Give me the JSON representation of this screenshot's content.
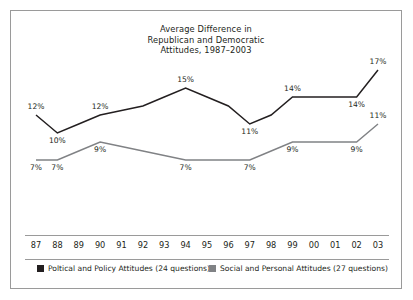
{
  "chart_data": {
    "type": "line",
    "title": "Average Difference in Republican and Democratic Attitudes, 1987–2003",
    "title_lines": [
      "Average Difference in",
      "Republican and Democratic",
      "Attitudes, 1987–2003"
    ],
    "xlabel": "",
    "ylabel": "",
    "ylim": [
      0,
      20
    ],
    "grid": false,
    "legend_position": "bottom",
    "categories": [
      "87",
      "88",
      "89",
      "90",
      "91",
      "92",
      "93",
      "94",
      "95",
      "96",
      "97",
      "98",
      "99",
      "00",
      "01",
      "02",
      "03"
    ],
    "series": [
      {
        "name": "Poltical and Policy Attitudes (24 questions)",
        "color": "#231f20",
        "values": [
          12,
          10,
          11,
          12,
          12.5,
          13,
          14,
          15,
          14,
          13,
          11,
          12,
          14,
          14,
          14,
          14,
          17
        ],
        "labels": [
          {
            "index": 0,
            "text": "12%",
            "pos": "above"
          },
          {
            "index": 1,
            "text": "10%",
            "pos": "below"
          },
          {
            "index": 3,
            "text": "12%",
            "pos": "above"
          },
          {
            "index": 7,
            "text": "15%",
            "pos": "above"
          },
          {
            "index": 10,
            "text": "11%",
            "pos": "below"
          },
          {
            "index": 12,
            "text": "14%",
            "pos": "above"
          },
          {
            "index": 15,
            "text": "14%",
            "pos": "below"
          },
          {
            "index": 16,
            "text": "17%",
            "pos": "above"
          }
        ]
      },
      {
        "name": "Social and Personal Attitudes (27 questions)",
        "color": "#808285",
        "values": [
          7,
          7,
          8,
          9,
          8.5,
          8,
          7.5,
          7,
          7,
          7,
          7,
          8,
          9,
          9,
          9,
          9,
          11
        ],
        "labels": [
          {
            "index": 0,
            "text": "7%",
            "pos": "below"
          },
          {
            "index": 1,
            "text": "7%",
            "pos": "below"
          },
          {
            "index": 3,
            "text": "9%",
            "pos": "below"
          },
          {
            "index": 7,
            "text": "7%",
            "pos": "below"
          },
          {
            "index": 10,
            "text": "7%",
            "pos": "below"
          },
          {
            "index": 12,
            "text": "9%",
            "pos": "below"
          },
          {
            "index": 15,
            "text": "9%",
            "pos": "below"
          },
          {
            "index": 16,
            "text": "11%",
            "pos": "above"
          }
        ]
      }
    ]
  },
  "legend": [
    {
      "label": "Poltical and Policy Attitudes (24 questions)",
      "color": "#231f20"
    },
    {
      "label": "Social and Personal Attitudes (27 questions)",
      "color": "#808285"
    }
  ]
}
